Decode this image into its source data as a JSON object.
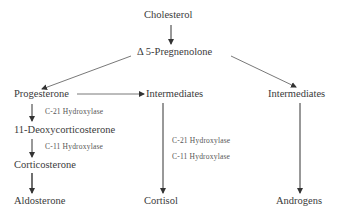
{
  "diagram": {
    "nodes": {
      "cholesterol": "Cholesterol",
      "pregnenolone": "Δ 5-Pregnenolone",
      "progesterone": "Progesterone",
      "intermediates_mid": "Intermediates",
      "intermediates_right": "Intermediates",
      "deoxycorticosterone": "11-Deoxycorticosterone",
      "corticosterone": "Corticosterone",
      "aldosterone": "Aldosterone",
      "cortisol": "Cortisol",
      "androgens": "Androgens"
    },
    "enzymes": {
      "left_c21": "C-21 Hydroxylase",
      "left_c11": "C-11 Hydroxylase",
      "mid_c21": "C-21 Hydroxylase",
      "mid_c11": "C-11 Hydroxylase"
    },
    "edges": [
      {
        "from": "cholesterol",
        "to": "pregnenolone"
      },
      {
        "from": "pregnenolone",
        "to": "progesterone"
      },
      {
        "from": "pregnenolone",
        "to": "intermediates_right"
      },
      {
        "from": "progesterone",
        "to": "intermediates_mid"
      },
      {
        "from": "progesterone",
        "to": "deoxycorticosterone",
        "label": "C-21 Hydroxylase"
      },
      {
        "from": "deoxycorticosterone",
        "to": "corticosterone",
        "label": "C-11 Hydroxylase"
      },
      {
        "from": "corticosterone",
        "to": "aldosterone"
      },
      {
        "from": "intermediates_mid",
        "to": "cortisol",
        "label": "C-21 Hydroxylase, C-11 Hydroxylase"
      },
      {
        "from": "intermediates_right",
        "to": "androgens"
      }
    ]
  }
}
